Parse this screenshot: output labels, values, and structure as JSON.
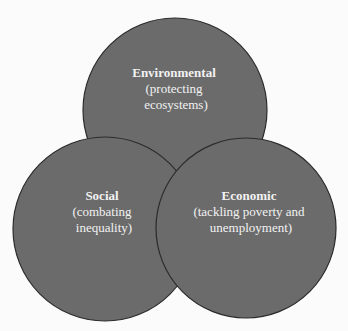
{
  "diagram": {
    "type": "venn",
    "background": "#fbfbfb",
    "fill_color": "#6b6b6b",
    "stroke_color": "#2b2b2b",
    "text_color": "#f2f2f2",
    "circles": [
      {
        "id": "environmental",
        "cx": 175,
        "cy": 110,
        "r": 92,
        "title": "Environmental",
        "lines": [
          "(protecting",
          "ecosystems)"
        ],
        "text_x": 176,
        "title_y": 77,
        "line_ys": [
          93,
          109
        ]
      },
      {
        "id": "social",
        "cx": 105,
        "cy": 229,
        "r": 92,
        "title": "Social",
        "lines": [
          "(combating",
          "inequality)"
        ],
        "text_x": 104,
        "title_y": 200,
        "line_ys": [
          216,
          232
        ]
      },
      {
        "id": "economic",
        "cx": 246,
        "cy": 228,
        "r": 90,
        "title": "Economic",
        "lines": [
          "(tackling poverty and",
          "unemployment)"
        ],
        "text_x": 251,
        "title_y": 200,
        "line_ys": [
          216,
          232
        ]
      }
    ]
  }
}
